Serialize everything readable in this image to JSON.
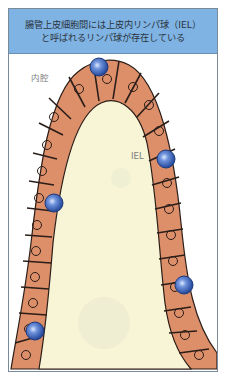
{
  "header": {
    "line1": "腸管上皮細胞間には上皮内リンパ球（IEL）",
    "line2": "と呼ばれるリンパ球が存在している"
  },
  "labels": {
    "lumen": "内腔",
    "iel": "IEL"
  },
  "colors": {
    "header_bg": "#7fb3e3",
    "epithelium": "#dd8f6a",
    "lamina_propria": "#f7f5d6",
    "iel_cell": "#3a63b8",
    "outline": "#2b1d18"
  }
}
